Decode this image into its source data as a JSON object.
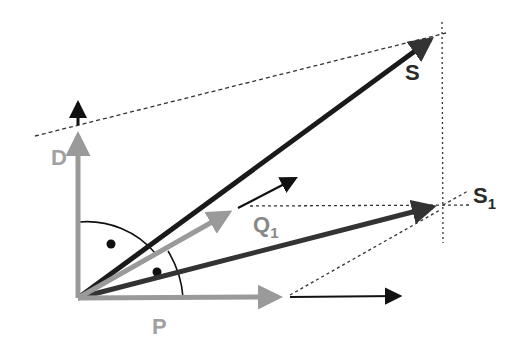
{
  "diagram": {
    "type": "vector-decomposition",
    "colors": {
      "gray_vector": "#9a9a9a",
      "black_vector": "#111111",
      "dark_vector": "#333333",
      "label_gray": "#a0a0a0",
      "label_dark": "#2a2a2a",
      "dashed": "#333333"
    },
    "labels": {
      "S": "S",
      "S1_main": "S",
      "S1_sub": "1",
      "Q1_main": "Q",
      "Q1_sub": "1",
      "D": "D",
      "P": "P"
    },
    "vectors": [
      {
        "name": "S",
        "from": [
          78,
          298
        ],
        "to": [
          440,
          33
        ],
        "color": "black"
      },
      {
        "name": "S1",
        "from": [
          78,
          298
        ],
        "to": [
          443,
          205
        ],
        "color": "dark"
      },
      {
        "name": "Q1",
        "from": [
          78,
          298
        ],
        "to": [
          238,
          208
        ],
        "color": "gray"
      },
      {
        "name": "Q1-extension",
        "from": [
          238,
          208
        ],
        "to": [
          298,
          177
        ],
        "color": "black"
      },
      {
        "name": "D",
        "from": [
          78,
          298
        ],
        "to": [
          78,
          123
        ],
        "color": "gray"
      },
      {
        "name": "D-extension",
        "from": [
          78,
          123
        ],
        "to": [
          78,
          98
        ],
        "color": "black"
      },
      {
        "name": "P",
        "from": [
          78,
          298
        ],
        "to": [
          290,
          297
        ],
        "color": "gray"
      },
      {
        "name": "P-extension",
        "from": [
          290,
          297
        ],
        "to": [
          402,
          296
        ],
        "color": "black"
      }
    ],
    "angle_markers": [
      {
        "name": "angle-D-S",
        "dot": [
          111,
          244
        ]
      },
      {
        "name": "angle-S1-P",
        "dot": [
          157,
          272
        ]
      }
    ]
  }
}
